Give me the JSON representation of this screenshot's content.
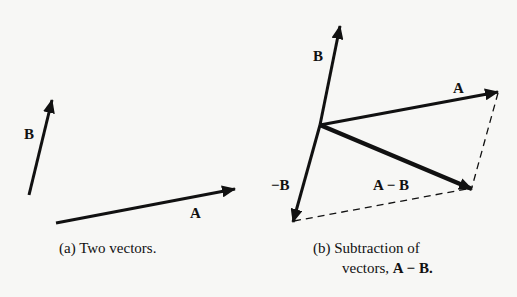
{
  "figure_a": {
    "label_A": "A",
    "label_B": "B",
    "caption": "(a)  Two vectors."
  },
  "figure_b": {
    "label_A": "A",
    "label_B": "B",
    "label_negB": "−B",
    "label_AminusB": "A − B",
    "caption_line1": "(b)  Subtraction of",
    "caption_line2_prefix": "vectors, ",
    "caption_line2_bold": "A − B."
  },
  "colors": {
    "ink": "#111111",
    "background": "#f7f7f5"
  }
}
